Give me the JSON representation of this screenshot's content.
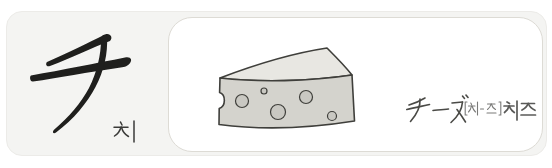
{
  "page_background": "#ffffff",
  "card": {
    "card_background": "#f4f4f2",
    "card_border_color": "#ecebe8",
    "character": {
      "glyph": "チ",
      "korean_reading": "치",
      "ink_color": "#1f1f1d",
      "reading_color": "#3a3a38"
    },
    "example": {
      "box_background": "#ffffff",
      "box_border_color": "#dddbd5",
      "word_katakana": "チーズ",
      "word_pronunciation": "[치-즈]",
      "word_meaning": "치즈",
      "katakana_color": "#4a4a46",
      "pronunciation_color": "#7a7a78",
      "meaning_color": "#5a5a58",
      "illustration": {
        "name": "cheese-wedge",
        "front_color": "#d4d3cd",
        "top_color": "#e8e7e2",
        "hole_color": "#c9c8c2",
        "outline_color": "#3f3f3b"
      }
    }
  }
}
